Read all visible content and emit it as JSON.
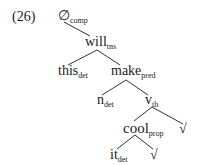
{
  "example_number": "(26)",
  "nodes": {
    "root": {
      "head": "∅",
      "sub": "comp"
    },
    "will": {
      "head": "will",
      "sub": "tns"
    },
    "this": {
      "head": "this",
      "sub": "det"
    },
    "make": {
      "head": "make",
      "sub": "pred"
    },
    "n": {
      "head": "n",
      "sub": "det"
    },
    "v": {
      "head": "v",
      "sub": "th"
    },
    "cool": {
      "head": "cool",
      "sub": "prop"
    },
    "root_sym_1": {
      "head": "√"
    },
    "it": {
      "head": "it",
      "sub": "det"
    },
    "root_sym_2": {
      "head": "√"
    }
  },
  "edges": [
    [
      "root",
      "will"
    ],
    [
      "will",
      "this"
    ],
    [
      "will",
      "make"
    ],
    [
      "make",
      "n"
    ],
    [
      "make",
      "v"
    ],
    [
      "v",
      "cool"
    ],
    [
      "v",
      "root_sym_1"
    ],
    [
      "cool",
      "it"
    ],
    [
      "cool",
      "root_sym_2"
    ]
  ]
}
